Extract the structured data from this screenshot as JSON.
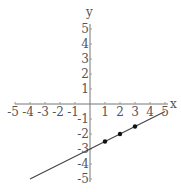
{
  "chart_data": {
    "type": "line",
    "title": "",
    "xlabel": "x",
    "ylabel": "y",
    "xlim": [
      -5,
      5
    ],
    "ylim": [
      -5,
      5
    ],
    "grid": false,
    "x_ticks": [
      -5,
      -4,
      -3,
      -2,
      -1,
      1,
      2,
      3,
      4,
      5
    ],
    "y_ticks": [
      5,
      4,
      3,
      2,
      1,
      -1,
      -2,
      -3,
      -4,
      -5
    ],
    "x_tick_labels": [
      "-5",
      "-4",
      "-3",
      "-2",
      "-1",
      "1",
      "2",
      "3",
      "4",
      "5"
    ],
    "y_tick_labels": [
      "5",
      "4",
      "3",
      "2",
      "1",
      "-1",
      "-2",
      "-3",
      "-4",
      "-5"
    ],
    "series": [
      {
        "name": "line",
        "equation": "y = 0.5x - 3",
        "x": [
          -4,
          5
        ],
        "y": [
          -5,
          -0.5
        ]
      },
      {
        "name": "points",
        "x": [
          1,
          2,
          3
        ],
        "y": [
          -2.5,
          -2,
          -1.5
        ]
      }
    ]
  },
  "axes": {
    "x_label": "x",
    "y_label": "y"
  },
  "colors": {
    "axis": "#777777",
    "line": "#444444",
    "point": "#111111",
    "text": "#555555"
  }
}
